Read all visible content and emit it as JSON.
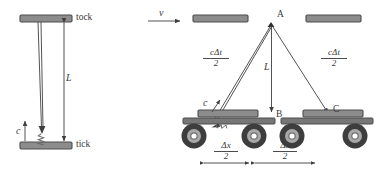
{
  "figure": {
    "colors": {
      "plate_fill": "#8c8c8c",
      "plate_stroke": "#4d4d4d",
      "line": "#3f3f3f",
      "text": "#3a3a3a",
      "wheel_outer": "#3d3d3d",
      "wheel_mid": "#a8a8a8",
      "wheel_hub": "#6e6e6e",
      "cart_body": "#777777",
      "background": "#ffffff"
    }
  },
  "left_panel": {
    "name": "stationary-light-clock",
    "top_plate_label": "tock",
    "bottom_plate_label": "tick",
    "length_label": "L",
    "speed_label": "c",
    "photon_icon": "wavy-light-ray"
  },
  "right_panel": {
    "name": "moving-light-clock",
    "velocity_label": "v",
    "length_label": "L",
    "speed_label": "c",
    "points": [
      {
        "id": "A",
        "label": "A"
      },
      {
        "id": "B",
        "label": "B"
      },
      {
        "id": "C",
        "label": "C"
      }
    ],
    "diagonal_left_label": {
      "numerator": "cΔt",
      "denominator": "2"
    },
    "diagonal_right_label": {
      "numerator": "cΔt",
      "denominator": "2"
    },
    "displacement_left_label": {
      "numerator": "Δx",
      "denominator": "2"
    },
    "displacement_right_label": {
      "numerator": "Δx",
      "denominator": "2"
    }
  }
}
